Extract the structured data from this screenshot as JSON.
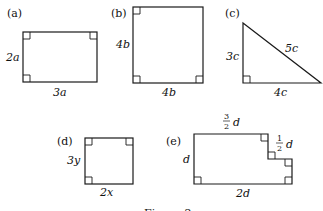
{
  "figure": {
    "caption": "Figure 2",
    "line_color": "#1a1a1a",
    "shapes": [
      {
        "id": "a",
        "tag": "(a)",
        "type": "rectangle",
        "side_label": "2a",
        "bottom_label": "3a",
        "right_angles": 3
      },
      {
        "id": "b",
        "tag": "(b)",
        "type": "square",
        "side_label": "4b",
        "bottom_label": "4b",
        "right_angles": 3
      },
      {
        "id": "c",
        "tag": "(c)",
        "type": "right-triangle",
        "side_label": "3c",
        "hypotenuse_label": "5c",
        "bottom_label": "4c",
        "right_angles": 1
      },
      {
        "id": "d",
        "tag": "(d)",
        "type": "rectangle",
        "side_label": "3y",
        "bottom_label": "2x",
        "right_angles": 3
      },
      {
        "id": "e",
        "tag": "(e)",
        "type": "notched-rectangle",
        "side_label": "d",
        "top_label_num": "3",
        "top_label_den": "2",
        "top_label_var": "d",
        "step_label_num": "1",
        "step_label_den": "2",
        "step_label_var": "d",
        "bottom_label": "2d",
        "right_angles": 6
      }
    ]
  }
}
